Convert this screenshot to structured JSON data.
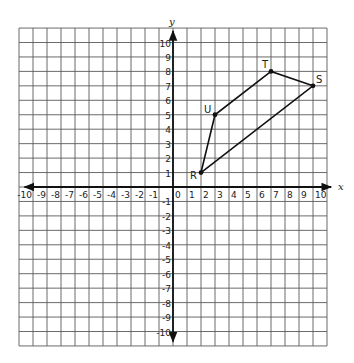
{
  "chart_data": {
    "type": "coordinate-plane",
    "xlabel": "x",
    "ylabel": "y",
    "xlim": [
      -10,
      10
    ],
    "ylim": [
      -10,
      10
    ],
    "grid": true,
    "x_ticks": [
      -10,
      -9,
      -8,
      -7,
      -6,
      -5,
      -4,
      -3,
      -2,
      -1,
      0,
      1,
      2,
      3,
      4,
      5,
      6,
      7,
      8,
      9,
      10
    ],
    "y_ticks": [
      -10,
      -9,
      -8,
      -7,
      -6,
      -5,
      -4,
      -3,
      -2,
      -1,
      1,
      2,
      3,
      4,
      5,
      6,
      7,
      8,
      9,
      10
    ],
    "polygon": {
      "name": "RSTU",
      "vertices": [
        {
          "label": "R",
          "x": 2,
          "y": 1
        },
        {
          "label": "S",
          "x": 10,
          "y": 7
        },
        {
          "label": "T",
          "x": 7,
          "y": 8
        },
        {
          "label": "U",
          "x": 3,
          "y": 5
        }
      ]
    }
  },
  "layout": {
    "origin_px": [
      173,
      187
    ],
    "unit_x_px": 14,
    "unit_y_px": 14.45,
    "grid_cells_each_side": 11,
    "grid_color": "#5a5a5a",
    "axis_color": "#111111"
  }
}
